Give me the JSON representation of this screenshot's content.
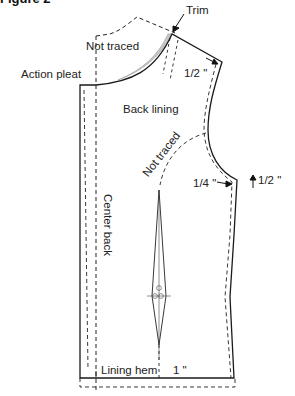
{
  "figure": {
    "title": "Figure 2"
  },
  "labels": {
    "trim": "Trim",
    "not_traced_top": "Not traced",
    "action_pleat": "Action pleat",
    "shoulder_half_inch": "1/2 \"",
    "back_lining": "Back lining",
    "not_traced_armhole": "Not traced",
    "quarter_inch": "1/4 \"",
    "side_half_inch": "1/2 \"",
    "center_back": "Center back",
    "lining_hem": "Lining hem",
    "hem_inch": "1 \""
  },
  "colors": {
    "line": "#1a1a1a",
    "trim_fill": "#c8c8c8"
  }
}
